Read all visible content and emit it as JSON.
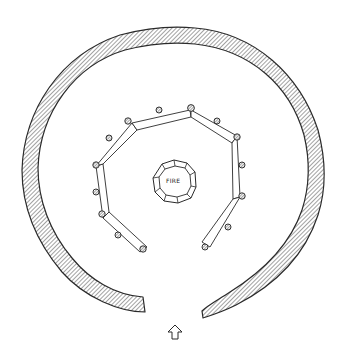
{
  "diagram": {
    "type": "floor-plan",
    "hearth": {
      "label": "FIRE",
      "center": [
        175,
        183
      ],
      "stones": 12
    },
    "outer_wall": {
      "style": "hatched",
      "center": [
        174,
        178
      ],
      "rx": 147,
      "ry": 146,
      "gap": "bottom (entrance)"
    },
    "inner_benches": {
      "left": [
        [
          147,
          247
        ],
        [
          107,
          215
        ],
        [
          100,
          165
        ],
        [
          135,
          127
        ],
        [
          191,
          113
        ]
      ],
      "right": [
        [
          191,
          113
        ],
        [
          235,
          139
        ],
        [
          234,
          197
        ],
        [
          204,
          246
        ]
      ]
    },
    "posts": [
      [
        139,
        189
      ],
      [
        143,
        247
      ],
      [
        118,
        235
      ],
      [
        101,
        212
      ],
      [
        96,
        192
      ],
      [
        99,
        164
      ],
      [
        109,
        138
      ],
      [
        128,
        121
      ],
      [
        159,
        110
      ],
      [
        191,
        108
      ],
      [
        216,
        120
      ],
      [
        237,
        137
      ],
      [
        242,
        164
      ],
      [
        242,
        196
      ],
      [
        228,
        228
      ],
      [
        205,
        247
      ]
    ],
    "entrance_arrow": {
      "direction": "up",
      "position": [
        175,
        333
      ]
    },
    "colors": {
      "ink": "#2a2a2a",
      "hatch": "#555555",
      "paper": "#ffffff"
    }
  }
}
